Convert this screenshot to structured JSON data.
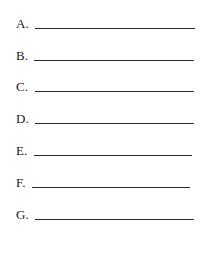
{
  "items": [
    {
      "label": "A."
    },
    {
      "label": "B."
    },
    {
      "label": "C."
    },
    {
      "label": "D."
    },
    {
      "label": "E."
    },
    {
      "label": "F."
    },
    {
      "label": "G."
    }
  ]
}
